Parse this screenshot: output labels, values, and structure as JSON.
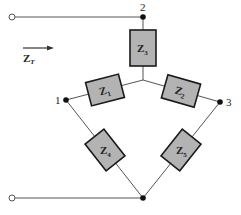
{
  "diagram": {
    "type": "delta-wye impedance network",
    "input_label": {
      "main": "Z",
      "sub": "T"
    },
    "nodes": [
      {
        "id": "1",
        "label": "1"
      },
      {
        "id": "2",
        "label": "2"
      },
      {
        "id": "3",
        "label": "3"
      }
    ],
    "impedances": [
      {
        "id": "Z1",
        "main": "Z",
        "sub": "1"
      },
      {
        "id": "Z2",
        "main": "Z",
        "sub": "2"
      },
      {
        "id": "Z3",
        "main": "Z",
        "sub": "3"
      },
      {
        "id": "Z4",
        "main": "Z",
        "sub": "4"
      },
      {
        "id": "Z5",
        "main": "Z",
        "sub": "5"
      }
    ],
    "colors": {
      "impedance_fill": "#b3b3b3",
      "impedance_stroke": "#1a1a1a",
      "wire": "#555555",
      "node": "#111111"
    }
  }
}
